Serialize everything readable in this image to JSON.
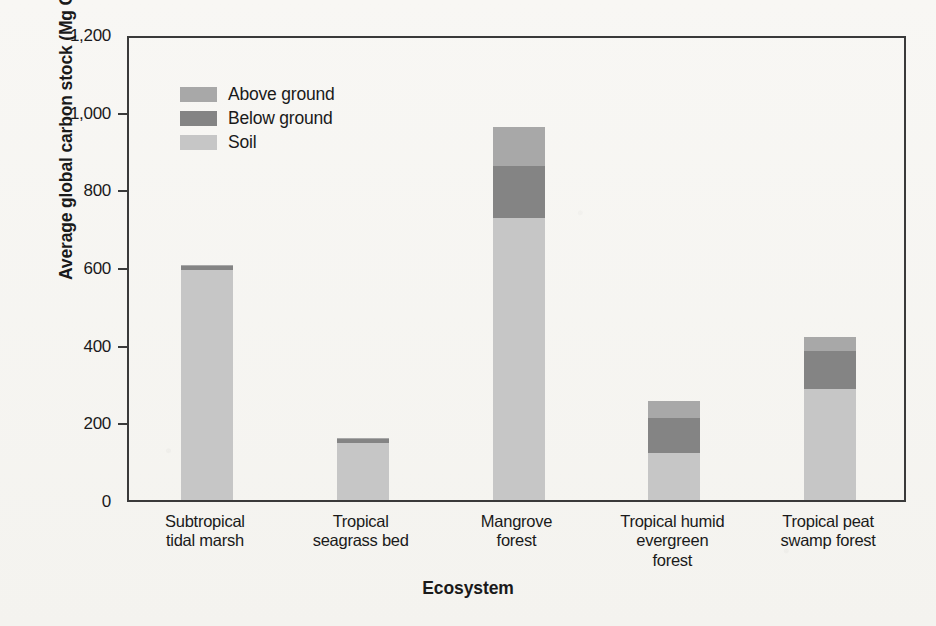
{
  "figure": {
    "background_color": "#f6f5f2",
    "axis_color": "#3a3a3a"
  },
  "colors": {
    "above_ground": "#a8a8a8",
    "below_ground": "#848484",
    "soil": "#c6c6c6"
  },
  "axes": {
    "ylabel_prefix": "Average global carbon stock (Mg C ha",
    "ylabel_exponent": "−1",
    "ylabel_suffix": ")",
    "ylabel_full": "Average global carbon stock (Mg C ha−1)",
    "xlabel": "Ecosystem",
    "ytick_labels": [
      "0",
      "200",
      "400",
      "600",
      "800",
      "1,000",
      "1,200"
    ],
    "ytick_values": [
      0,
      200,
      400,
      600,
      800,
      1000,
      1200
    ]
  },
  "legend": {
    "position": "top-left-inside",
    "items": [
      {
        "label": "Above ground",
        "color": "#a8a8a8"
      },
      {
        "label": "Below ground",
        "color": "#848484"
      },
      {
        "label": "Soil",
        "color": "#c6c6c6"
      }
    ]
  },
  "categories_display": [
    [
      "Subtropical",
      "tidal marsh"
    ],
    [
      "Tropical",
      "seagrass bed"
    ],
    [
      "Mangrove",
      "forest"
    ],
    [
      "Tropical humid",
      "evergreen",
      "forest"
    ],
    [
      "Tropical peat",
      "swamp forest"
    ]
  ],
  "chart_data": {
    "type": "bar",
    "subtype": "stacked-vertical",
    "title": "",
    "xlabel": "Ecosystem",
    "ylabel": "Average global carbon stock (Mg C ha−1)",
    "ylim": [
      0,
      1200
    ],
    "ytick_values": [
      0,
      200,
      400,
      600,
      800,
      1000,
      1200
    ],
    "grid": false,
    "legend_position": "upper left (inside plot)",
    "categories": [
      "Subtropical tidal marsh",
      "Tropical seagrass bed",
      "Mangrove forest",
      "Tropical humid evergreen forest",
      "Tropical peat swamp forest"
    ],
    "series": [
      {
        "name": "Soil",
        "color": "#c6c6c6",
        "values": [
          593,
          148,
          725,
          120,
          285
        ]
      },
      {
        "name": "Below ground",
        "color": "#848484",
        "values": [
          10,
          9,
          135,
          92,
          100
        ]
      },
      {
        "name": "Above ground",
        "color": "#a8a8a8",
        "values": [
          2,
          3,
          100,
          43,
          35
        ]
      }
    ],
    "totals": [
      605,
      160,
      960,
      255,
      420
    ],
    "stack_order_bottom_to_top": [
      "Soil",
      "Below ground",
      "Above ground"
    ]
  }
}
